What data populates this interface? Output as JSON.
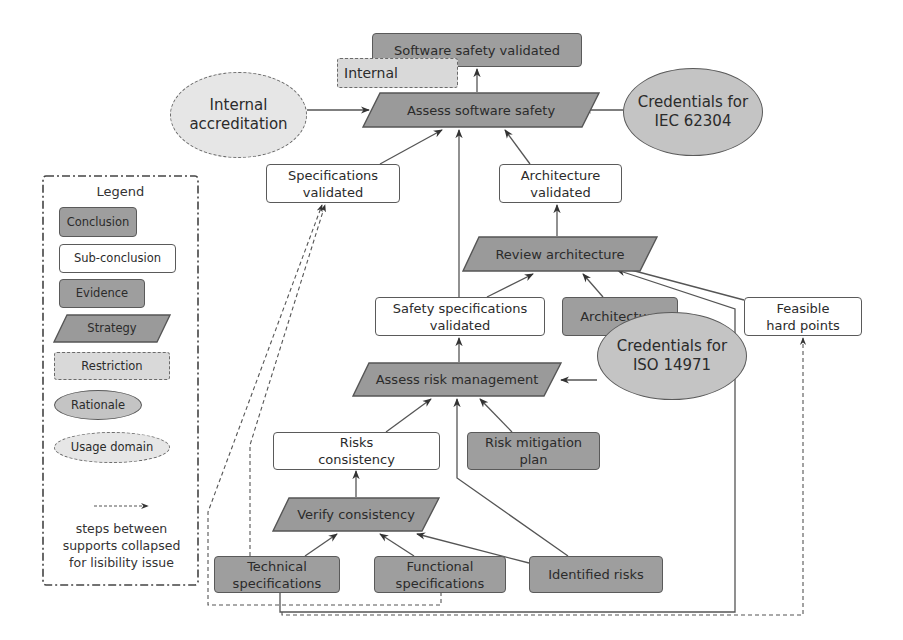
{
  "diagram": {
    "type": "safety-argument-structure",
    "nodes": {
      "software_safety_validated": {
        "label": "Software safety validated",
        "kind": "Conclusion"
      },
      "internal": {
        "label": "Internal",
        "kind": "Restriction"
      },
      "internal_accreditation": {
        "label_line1": "Internal",
        "label_line2": "accreditation",
        "kind": "Usage domain"
      },
      "assess_software_safety": {
        "label": "Assess software safety",
        "kind": "Strategy"
      },
      "credentials_iec": {
        "label_line1": "Credentials for",
        "label_line2": "IEC 62304",
        "kind": "Rationale"
      },
      "specifications_validated": {
        "label_line1": "Specifications",
        "label_line2": "validated",
        "kind": "Sub-conclusion"
      },
      "architecture_validated": {
        "label_line1": "Architecture",
        "label_line2": "validated",
        "kind": "Sub-conclusion"
      },
      "review_architecture": {
        "label": "Review architecture",
        "kind": "Strategy"
      },
      "safety_specifications_validated": {
        "label_line1": "Safety specifications",
        "label_line2": "validated",
        "kind": "Sub-conclusion"
      },
      "architecture": {
        "label": "Architecture",
        "kind": "Evidence"
      },
      "feasible_hard_points": {
        "label_line1": "Feasible",
        "label_line2": "hard points",
        "kind": "Sub-conclusion"
      },
      "assess_risk_management": {
        "label": "Assess risk management",
        "kind": "Strategy"
      },
      "credentials_iso": {
        "label_line1": "Credentials for",
        "label_line2": "ISO 14971",
        "kind": "Rationale"
      },
      "risks_consistency": {
        "label_line1": "Risks",
        "label_line2": "consistency",
        "kind": "Sub-conclusion"
      },
      "risk_mitigation_plan": {
        "label_line1": "Risk mitigation",
        "label_line2": "plan",
        "kind": "Evidence"
      },
      "verify_consistency": {
        "label": "Verify consistency",
        "kind": "Strategy"
      },
      "technical_specifications": {
        "label_line1": "Technical",
        "label_line2": "specifications",
        "kind": "Evidence"
      },
      "functional_specifications": {
        "label_line1": "Functional",
        "label_line2": "specifications",
        "kind": "Evidence"
      },
      "identified_risks": {
        "label": "Identified risks",
        "kind": "Evidence"
      }
    },
    "edges": [
      {
        "from": "assess_software_safety",
        "to": "software_safety_validated",
        "style": "solid"
      },
      {
        "from": "internal_accreditation",
        "to": "assess_software_safety",
        "style": "solid"
      },
      {
        "from": "credentials_iec",
        "to": "assess_software_safety",
        "style": "solid"
      },
      {
        "from": "specifications_validated",
        "to": "assess_software_safety",
        "style": "solid"
      },
      {
        "from": "safety_specifications_validated",
        "to": "assess_software_safety",
        "style": "solid"
      },
      {
        "from": "architecture_validated",
        "to": "assess_software_safety",
        "style": "solid"
      },
      {
        "from": "review_architecture",
        "to": "architecture_validated",
        "style": "solid"
      },
      {
        "from": "safety_specifications_validated",
        "to": "review_architecture",
        "style": "solid"
      },
      {
        "from": "architecture",
        "to": "review_architecture",
        "style": "solid"
      },
      {
        "from": "feasible_hard_points",
        "to": "review_architecture",
        "style": "solid"
      },
      {
        "from": "identified_risks",
        "to": "review_architecture",
        "style": "solid"
      },
      {
        "from": "assess_risk_management",
        "to": "safety_specifications_validated",
        "style": "solid"
      },
      {
        "from": "credentials_iso",
        "to": "assess_risk_management",
        "style": "solid"
      },
      {
        "from": "risks_consistency",
        "to": "assess_risk_management",
        "style": "solid"
      },
      {
        "from": "identified_risks",
        "to": "assess_risk_management",
        "style": "solid"
      },
      {
        "from": "risk_mitigation_plan",
        "to": "assess_risk_management",
        "style": "solid"
      },
      {
        "from": "verify_consistency",
        "to": "risks_consistency",
        "style": "solid"
      },
      {
        "from": "technical_specifications",
        "to": "verify_consistency",
        "style": "solid"
      },
      {
        "from": "functional_specifications",
        "to": "verify_consistency",
        "style": "solid"
      },
      {
        "from": "identified_risks",
        "to": "verify_consistency",
        "style": "solid"
      },
      {
        "from": "technical_specifications",
        "to": "specifications_validated",
        "style": "dashed"
      },
      {
        "from": "functional_specifications",
        "to": "specifications_validated",
        "style": "dashed"
      },
      {
        "from": "technical_specifications",
        "to": "feasible_hard_points",
        "style": "dashed"
      }
    ]
  },
  "legend": {
    "title": "Legend",
    "items": [
      {
        "label": "Conclusion"
      },
      {
        "label": "Sub-conclusion"
      },
      {
        "label": "Evidence"
      },
      {
        "label": "Strategy"
      },
      {
        "label": "Restriction"
      },
      {
        "label": "Rationale"
      },
      {
        "label": "Usage domain"
      }
    ],
    "dashed_arrow_note_line1": "steps between",
    "dashed_arrow_note_line2": "supports collapsed",
    "dashed_arrow_note_line3": "for lisibility issue"
  },
  "colors": {
    "conclusion_fill": "#9e9e9e",
    "evidence_fill": "#9e9e9e",
    "strategy_fill": "#9a9a9a",
    "rationale_fill": "#c4c4c4",
    "restriction_fill": "#d9d9d9",
    "usage_fill": "#e6e6e6",
    "sub_conclusion_fill": "#ffffff",
    "stroke": "#555555"
  }
}
